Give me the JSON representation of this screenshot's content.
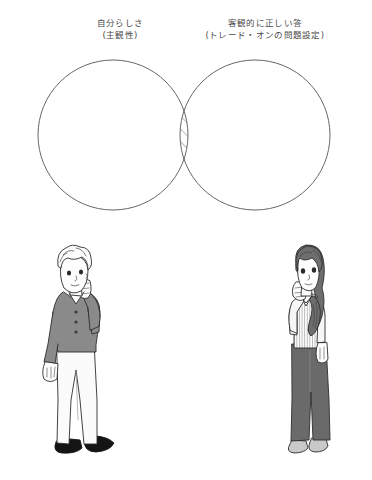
{
  "diagram": {
    "type": "venn",
    "title_present": false,
    "background_color": "#ffffff",
    "stroke_color": "#555555",
    "left_label": {
      "line1": "自分らしさ",
      "line2": "(主観性)"
    },
    "right_label": {
      "line1": "客観的に正しい答",
      "line2": "(トレード・オンの問題設定)"
    },
    "circles": [
      {
        "name": "left-circle",
        "cx": 113,
        "cy": 135,
        "r": 75
      },
      {
        "name": "right-circle",
        "cx": 255,
        "cy": 135,
        "r": 75
      }
    ],
    "intersection": {
      "name": "overlap-region",
      "fill": "hatched",
      "hatch_angle_deg": 45,
      "hatch_color": "#666666"
    }
  },
  "figures": {
    "male": {
      "name": "male-figure",
      "pose": "hand-to-chin-thinking",
      "hair": "short wavy",
      "top_color": "#8a8a8a",
      "pants_color": "#fbfbfb",
      "shoes_color": "#1a1a1a",
      "skin_color": "#fdfdfd"
    },
    "female": {
      "name": "female-figure",
      "pose": "hand-to-chin-thinking",
      "hair": "long side ponytail",
      "hair_color": "#6e6e6e",
      "top_color": "#fcfcfc",
      "top_pattern": "vertical pinstripe",
      "pants_color": "#6a6a6a",
      "shoes_color": "#c9c9c9",
      "skin_color": "#fdfdfd"
    }
  }
}
